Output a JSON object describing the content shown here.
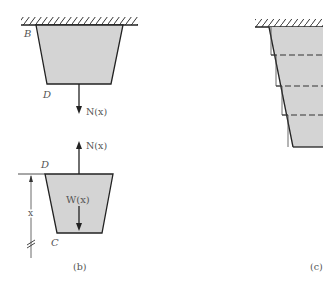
{
  "figure_b": {
    "caption": "(b)",
    "upper_part": {
      "top_label": "B",
      "bottom_label": "D",
      "force_label": "N(x)",
      "force_direction": "down"
    },
    "lower_part": {
      "top_label": "D",
      "bottom_label": "C",
      "force_label": "N(x)",
      "force_direction": "up",
      "weight_label": "W(x)",
      "dimension_label": "x"
    }
  },
  "figure_c": {
    "caption": "(c)",
    "segments": 4
  },
  "colors": {
    "fill": "#d4d4d4",
    "stroke": "#222222",
    "label": "#555555"
  }
}
